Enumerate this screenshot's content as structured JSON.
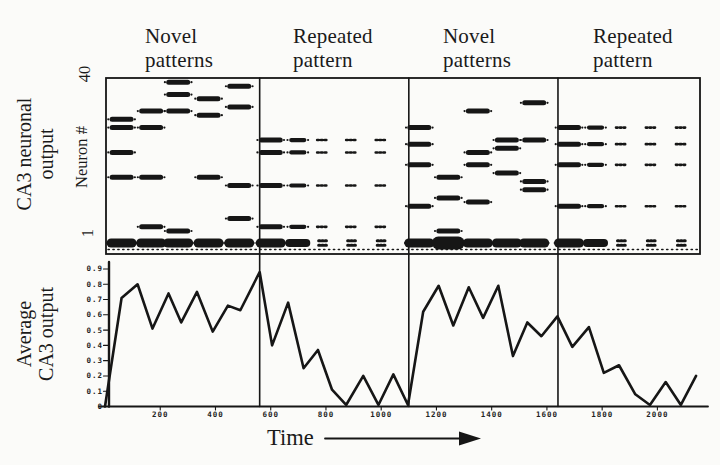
{
  "colors": {
    "paper": "#fbfbf9",
    "ink": "#161616"
  },
  "headers": [
    {
      "line1": "Novel",
      "line2": "patterns"
    },
    {
      "line1": "Repeated",
      "line2": "pattern"
    },
    {
      "line1": "Novel",
      "line2": "patterns"
    },
    {
      "line1": "Repeated",
      "line2": "pattern"
    }
  ],
  "raster_panel": {
    "outer_ylabel_line1": "CA3 neuronal",
    "outer_ylabel_line2": "output",
    "axis_ylabel": "Neuron #",
    "ytick_top": "40",
    "ytick_bottom": "1"
  },
  "line_panel": {
    "ylabel_line1": "Average",
    "ylabel_line2": "CA3 output",
    "xlabel": "Time"
  },
  "chart_data": [
    {
      "type": "scatter",
      "title": "CA3 neuronal output (spike raster)",
      "ylabel": "Neuron #",
      "xlim": [
        0,
        2156
      ],
      "ylim": [
        1,
        40
      ],
      "section_dividers_x": [
        560,
        1100,
        1640
      ],
      "baseline_dotted_row": true,
      "sections": [
        {
          "label": "Novel patterns",
          "t_start": 0,
          "t_end": 560,
          "columns": [
            {
              "t": 60,
              "neurons": [
                31,
                29,
                23,
                17
              ],
              "size": "lg",
              "bottom": "blob-lg"
            },
            {
              "t": 167,
              "neurons": [
                33,
                29,
                17,
                5
              ],
              "size": "lg",
              "bottom": "blob-lg"
            },
            {
              "t": 265,
              "neurons": [
                40,
                37,
                33,
                4
              ],
              "size": "lg",
              "bottom": "blob-lg"
            },
            {
              "t": 375,
              "neurons": [
                36,
                32,
                17
              ],
              "size": "lg",
              "bottom": "blob-lg"
            },
            {
              "t": 486,
              "neurons": [
                39,
                34,
                15,
                7
              ],
              "size": "lg",
              "bottom": "blob-lg"
            }
          ]
        },
        {
          "label": "Repeated pattern",
          "t_start": 560,
          "t_end": 1100,
          "columns": [
            {
              "t": 600,
              "neurons": [
                26,
                23,
                15,
                5
              ],
              "size": "lg",
              "bottom": "blob-lg"
            },
            {
              "t": 698,
              "neurons": [
                26,
                23,
                15,
                5
              ],
              "size": "md",
              "bottom": "blob-md"
            },
            {
              "t": 788,
              "neurons": [
                26,
                23,
                15,
                5
              ],
              "size": "sm",
              "bottom": "blob-sm"
            },
            {
              "t": 893,
              "neurons": [
                26,
                23,
                15,
                5
              ],
              "size": "sm",
              "bottom": "blob-sm"
            },
            {
              "t": 1000,
              "neurons": [
                26,
                23,
                15,
                5
              ],
              "size": "sm",
              "bottom": "blob-sm"
            }
          ]
        },
        {
          "label": "Novel patterns",
          "t_start": 1100,
          "t_end": 1640,
          "columns": [
            {
              "t": 1138,
              "neurons": [
                29,
                25,
                20,
                10
              ],
              "size": "lg",
              "bottom": "blob-lg"
            },
            {
              "t": 1243,
              "neurons": [
                17,
                12,
                4
              ],
              "size": "lg",
              "bottom": "blob-tall"
            },
            {
              "t": 1350,
              "neurons": [
                33,
                23,
                20,
                11
              ],
              "size": "lg",
              "bottom": "blob-lg"
            },
            {
              "t": 1455,
              "neurons": [
                26,
                24,
                18
              ],
              "size": "lg",
              "bottom": "blob-lg"
            },
            {
              "t": 1554,
              "neurons": [
                35,
                26,
                16,
                14
              ],
              "size": "lg",
              "bottom": "blob-lg"
            }
          ]
        },
        {
          "label": "Repeated pattern",
          "t_start": 1640,
          "t_end": 2156,
          "columns": [
            {
              "t": 1680,
              "neurons": [
                29,
                25,
                20,
                10
              ],
              "size": "lg",
              "bottom": "blob-lg"
            },
            {
              "t": 1776,
              "neurons": [
                29,
                25,
                20,
                10
              ],
              "size": "md",
              "bottom": "blob-md"
            },
            {
              "t": 1870,
              "neurons": [
                29,
                25,
                20,
                10
              ],
              "size": "sm",
              "bottom": "blob-sm"
            },
            {
              "t": 1978,
              "neurons": [
                29,
                25,
                20,
                10
              ],
              "size": "sm",
              "bottom": "blob-sm"
            },
            {
              "t": 2087,
              "neurons": [
                29,
                25,
                20,
                10
              ],
              "size": "sm",
              "bottom": "blob-sm"
            }
          ]
        }
      ]
    },
    {
      "type": "line",
      "title": "Average CA3 output",
      "xlabel": "Time",
      "ylabel": "Average CA3 output",
      "xlim": [
        0,
        2156
      ],
      "ylim": [
        0,
        0.9
      ],
      "xticks": [
        200,
        400,
        600,
        800,
        1000,
        1200,
        1400,
        1600,
        1800,
        2000
      ],
      "yticks": [
        0,
        0.1,
        0.2,
        0.3,
        0.4,
        0.5,
        0.6,
        0.7,
        0.8,
        0.9
      ],
      "section_dividers_x": [
        560,
        1100,
        1640
      ],
      "x": [
        0,
        60,
        118,
        172,
        230,
        276,
        333,
        390,
        445,
        490,
        560,
        605,
        663,
        719,
        771,
        822,
        873,
        935,
        990,
        1044,
        1097,
        1152,
        1208,
        1261,
        1317,
        1369,
        1424,
        1477,
        1529,
        1580,
        1638,
        1692,
        1752,
        1806,
        1861,
        1920,
        1973,
        2030,
        2085,
        2140
      ],
      "y": [
        0,
        0.71,
        0.8,
        0.51,
        0.74,
        0.55,
        0.75,
        0.49,
        0.66,
        0.63,
        0.88,
        0.4,
        0.68,
        0.25,
        0.37,
        0.11,
        0.01,
        0.2,
        0.01,
        0.21,
        0.01,
        0.62,
        0.79,
        0.53,
        0.78,
        0.58,
        0.79,
        0.33,
        0.55,
        0.46,
        0.59,
        0.39,
        0.52,
        0.22,
        0.27,
        0.08,
        0.01,
        0.16,
        0.01,
        0.2
      ]
    }
  ]
}
